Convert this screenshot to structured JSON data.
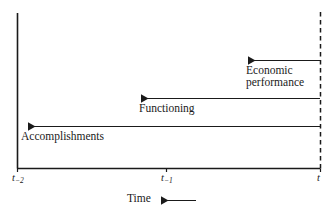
{
  "figure": {
    "type": "timeline-diagram",
    "background_color": "#ffffff",
    "line_color": "#1a1a1a",
    "axis": {
      "x_axis_label": "Time",
      "x_axis_arrow_direction": "right",
      "ticks": [
        {
          "name": "t-minus-2",
          "base": "t",
          "sub": "−2",
          "x": 17
        },
        {
          "name": "t-minus-1",
          "base": "t",
          "sub": "−1",
          "x": 166
        },
        {
          "name": "t",
          "base": "t",
          "sub": "",
          "x": 320
        }
      ],
      "origin_x": 17,
      "baseline_y": 168,
      "top_y": 13,
      "present_line_x": 320,
      "present_line_style": "dashed"
    },
    "arrows": [
      {
        "name": "economic-performance",
        "label_lines": [
          "Economic",
          "performance"
        ],
        "from_x": 320,
        "to_x": 247,
        "y": 60,
        "direction": "left",
        "spans_from_tick": "t",
        "label_position": "below-left-of-arrow"
      },
      {
        "name": "functioning",
        "label_lines": [
          "Functioning"
        ],
        "from_x": 320,
        "to_x": 140,
        "y": 98,
        "direction": "left",
        "spans_from_tick": "t",
        "label_position": "below-left-of-arrow"
      },
      {
        "name": "accomplishments",
        "label_lines": [
          "Accomplishments"
        ],
        "from_x": 320,
        "to_x": 27,
        "y": 126,
        "direction": "left",
        "spans_from_tick": "t",
        "label_position": "below-left-of-arrow"
      }
    ]
  }
}
